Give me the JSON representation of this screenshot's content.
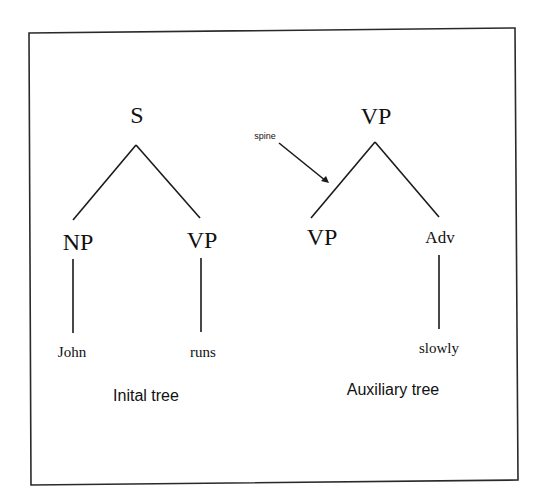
{
  "diagram": {
    "type": "tree-adjoining-grammar",
    "colors": {
      "ink": "#111111",
      "background": "#ffffff",
      "frame": "#2a2a2a"
    },
    "initial_tree": {
      "caption": "Inital tree",
      "root": {
        "label": "S"
      },
      "children": [
        {
          "label": "NP",
          "leaf": "John"
        },
        {
          "label": "VP",
          "leaf": "runs"
        }
      ]
    },
    "auxiliary_tree": {
      "caption": "Auxiliary tree",
      "root": {
        "label": "VP"
      },
      "children": [
        {
          "label": "VP",
          "leaf": ""
        },
        {
          "label": "Adv",
          "leaf": "slowly"
        }
      ],
      "annotation": {
        "label": "spine",
        "points_to": "edge VP-VP (foot)"
      }
    }
  }
}
